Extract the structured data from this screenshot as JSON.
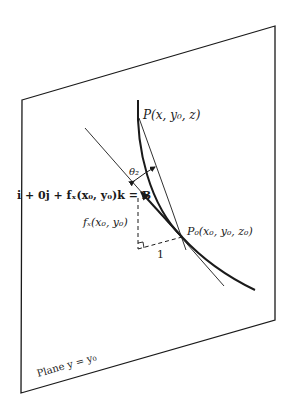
{
  "diagram": {
    "plane_label": "Plane y = y₀",
    "point_P": "P(x, y₀, z)",
    "point_P0": "P₀(x₀, y₀, z₀)",
    "angle_label": "θ₂",
    "vector_label": "i + 0j + fₓ(x₀, y₀)k = B",
    "rise_label": "fₓ(x₀, y₀)",
    "run_label": "1",
    "colors": {
      "line": "#1a1a1a",
      "background": "#ffffff"
    }
  }
}
